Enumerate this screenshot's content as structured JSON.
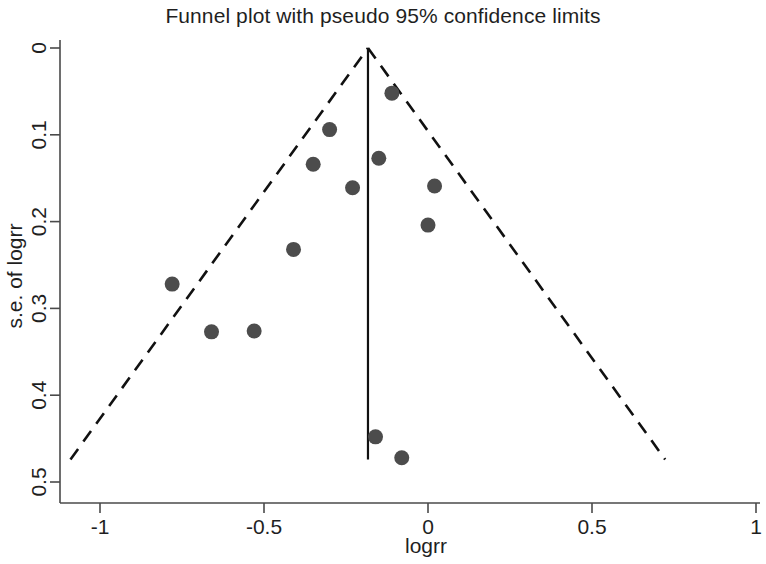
{
  "chart_data": {
    "type": "scatter",
    "title": "Funnel plot with pseudo 95% confidence limits",
    "xlabel": "logrr",
    "ylabel": "s.e. of logrr",
    "xlim": [
      -1.12,
      1.03
    ],
    "ylim": [
      0,
      0.5
    ],
    "y_axis_inverted": true,
    "grid": false,
    "legend": null,
    "x_ticks": [
      -1,
      -0.5,
      0,
      0.5,
      1
    ],
    "x_tick_labels": [
      "-1",
      "-0.5",
      "0",
      "0.5",
      "1"
    ],
    "y_ticks": [
      0,
      0.1,
      0.2,
      0.3,
      0.4,
      0.5
    ],
    "y_tick_labels": [
      "0",
      "0.1",
      "0.2",
      "0.3",
      "0.4",
      "0.5"
    ],
    "point_color": "#4c4c4c",
    "line_color": "#111111",
    "points": [
      {
        "x": -0.78,
        "y": 0.272
      },
      {
        "x": -0.66,
        "y": 0.327
      },
      {
        "x": -0.53,
        "y": 0.326
      },
      {
        "x": -0.41,
        "y": 0.232
      },
      {
        "x": -0.35,
        "y": 0.134
      },
      {
        "x": -0.3,
        "y": 0.094
      },
      {
        "x": -0.23,
        "y": 0.161
      },
      {
        "x": -0.15,
        "y": 0.127
      },
      {
        "x": -0.11,
        "y": 0.052
      },
      {
        "x": 0.02,
        "y": 0.159
      },
      {
        "x": 0.0,
        "y": 0.204
      },
      {
        "x": -0.16,
        "y": 0.448
      },
      {
        "x": -0.08,
        "y": 0.472
      }
    ],
    "pooled_effect": -0.183,
    "center_line": {
      "x": -0.183,
      "y_start": 0.0,
      "y_end": 0.474
    },
    "ci_limits": {
      "apex": {
        "x": -0.183,
        "y": 0.0
      },
      "left_end": {
        "x": -1.09,
        "y": 0.474
      },
      "right_end": {
        "x": 0.723,
        "y": 0.474
      },
      "description": "pseudo 95% confidence limits"
    }
  }
}
